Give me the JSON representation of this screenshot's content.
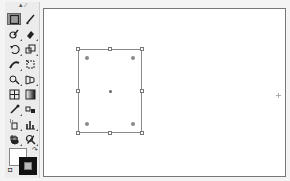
{
  "top_strip": {
    "text": "··· ·· · ········ ·········· · ········ ·· · ····· ·"
  },
  "toolbar": {
    "grip_label": "▲ ⁄",
    "tools": [
      {
        "name": "rectangle-tool",
        "active": true
      },
      {
        "name": "paintbrush-tool",
        "active": false
      },
      {
        "name": "blob-brush-tool",
        "active": false
      },
      {
        "name": "eraser-tool",
        "active": false
      },
      {
        "name": "rotate-tool",
        "active": false
      },
      {
        "name": "scale-tool",
        "active": false
      },
      {
        "name": "width-tool",
        "active": false
      },
      {
        "name": "free-transform-tool",
        "active": false
      },
      {
        "name": "shape-builder-tool",
        "active": false
      },
      {
        "name": "perspective-grid-tool",
        "active": false
      },
      {
        "name": "mesh-tool",
        "active": false
      },
      {
        "name": "gradient-tool",
        "active": false
      },
      {
        "name": "eyedropper-tool",
        "active": false
      },
      {
        "name": "blend-tool",
        "active": false
      },
      {
        "name": "symbol-sprayer-tool",
        "active": false
      },
      {
        "name": "column-graph-tool",
        "active": false
      },
      {
        "name": "artboard-tool",
        "active": false
      },
      {
        "name": "slice-tool",
        "active": false
      },
      {
        "name": "hand-tool",
        "active": false
      },
      {
        "name": "zoom-tool",
        "active": false
      }
    ],
    "swap_glyph": "↷",
    "default_glyph": "◘",
    "colors": {
      "fill": "#ffffff",
      "stroke": "#111111",
      "stroke_inner": "#bbbbbb",
      "active_tool_bg": "#9a9a9a"
    }
  },
  "canvas": {
    "background": "#ffffff",
    "border": "#777777",
    "selection": {
      "x": 34,
      "y": 40,
      "width": 64,
      "height": 84,
      "stroke": "#8a8a8a"
    }
  }
}
